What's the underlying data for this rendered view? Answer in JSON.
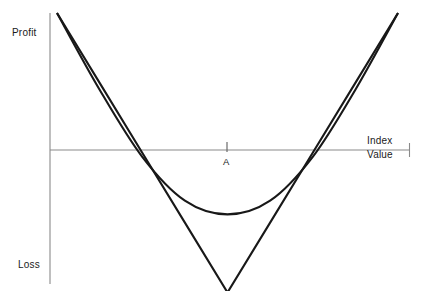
{
  "chart_data": {
    "type": "line",
    "title": "",
    "subtitle": "",
    "xlabel": "Index Value",
    "ylabel": "Profit / Loss",
    "grid": false,
    "legend": null,
    "axes": {
      "y_axis_top_label": "Profit",
      "y_axis_bottom_label": "Loss",
      "x_axis_label_line1": "Index",
      "x_axis_label_line2": "Value",
      "x_zero_line_y": 0,
      "x_tick_labels": [
        "A"
      ],
      "x_tick_positions": [
        0
      ],
      "y_tick_labels": [],
      "xlim": [
        -1.0,
        1.0
      ],
      "ylim": [
        -1.0,
        1.0
      ]
    },
    "annotations": [
      {
        "text": "A",
        "x": 0,
        "y": 0,
        "description": "strike / index reference point marked by tick on horizontal axis"
      }
    ],
    "series": [
      {
        "name": "long-straddle-expiry",
        "style": "straight-V",
        "description": "Piecewise-linear payoff at expiry: falls from maximum profit on the left to maximum loss at A, then rises symmetrically.",
        "x": [
          -1.0,
          -0.75,
          -0.5,
          -0.25,
          0.0,
          0.25,
          0.5,
          0.75,
          1.0
        ],
        "y": [
          1.0,
          0.49,
          -0.02,
          -0.53,
          -1.04,
          -0.53,
          -0.02,
          0.49,
          1.0
        ],
        "breakeven_x": [
          -0.46,
          0.47
        ],
        "vertex": {
          "x": 0.0,
          "y": -1.04
        }
      },
      {
        "name": "long-straddle-current",
        "style": "smooth-curve",
        "description": "Smooth rounded payoff before expiry: same endpoints but a shallower, curved minimum above the V vertex.",
        "x": [
          -1.0,
          -0.75,
          -0.5,
          -0.25,
          0.0,
          0.25,
          0.5,
          0.75,
          1.0
        ],
        "y": [
          1.0,
          0.44,
          -0.05,
          -0.37,
          -0.47,
          -0.37,
          -0.05,
          0.44,
          1.0
        ],
        "breakeven_x": [
          -0.33,
          0.34
        ],
        "minimum": {
          "x": 0.0,
          "y": -0.47
        }
      }
    ],
    "colors": {
      "curve": "#1a1a1a",
      "axis": "#808080",
      "text": "#1a1a1a",
      "background": "#ffffff"
    }
  },
  "labels": {
    "profit": "Profit",
    "loss": "Loss",
    "index": "Index",
    "value": "Value",
    "point_a": "A"
  },
  "geometry": {
    "y_axis_x": 50,
    "x_axis_y": 150,
    "y_axis_top": 13,
    "y_axis_bottom": 284,
    "x_axis_left": 50,
    "x_axis_right": 410,
    "center_tick_x": 227,
    "v_left_start": [
      57,
      13
    ],
    "v_vertex": [
      228,
      268
    ],
    "v_right_end": [
      398,
      12
    ],
    "curve_min": [
      228,
      182
    ]
  }
}
